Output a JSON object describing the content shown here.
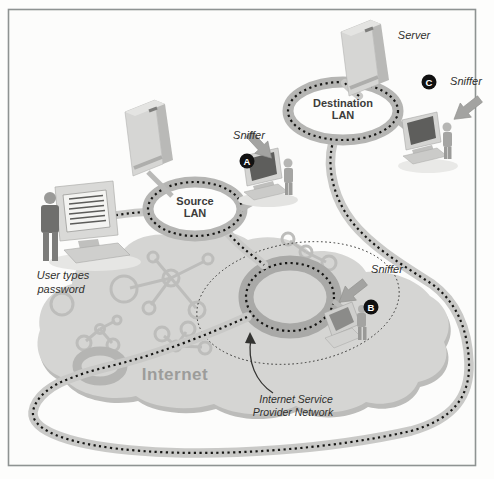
{
  "figure": {
    "labels": {
      "server": "Server",
      "sniffer_a": "Sniffer",
      "sniffer_b": "Sniffer",
      "sniffer_c": "Sniffer",
      "source_lan": {
        "line1": "Source",
        "line2": "LAN"
      },
      "destination_lan": {
        "line1": "Destination",
        "line2": "LAN"
      },
      "internet": "Internet",
      "isp": {
        "line1": "Internet Service",
        "line2": "Provider Network"
      },
      "user_caption": {
        "line1": "User types",
        "line2": "password"
      },
      "badges": {
        "a": "A",
        "b": "B",
        "c": "C"
      }
    },
    "colors": {
      "cloud": "#d5d5d3",
      "cloud_shadow": "#bcbcba",
      "ring": "#b5b5b3",
      "isp_ring": "#a9a9a7",
      "road": "#c9c9c7",
      "dots": "#161614",
      "badge": "#111111",
      "arrow": "#a3a3a1",
      "internet_text": "#9c9c9a"
    }
  }
}
